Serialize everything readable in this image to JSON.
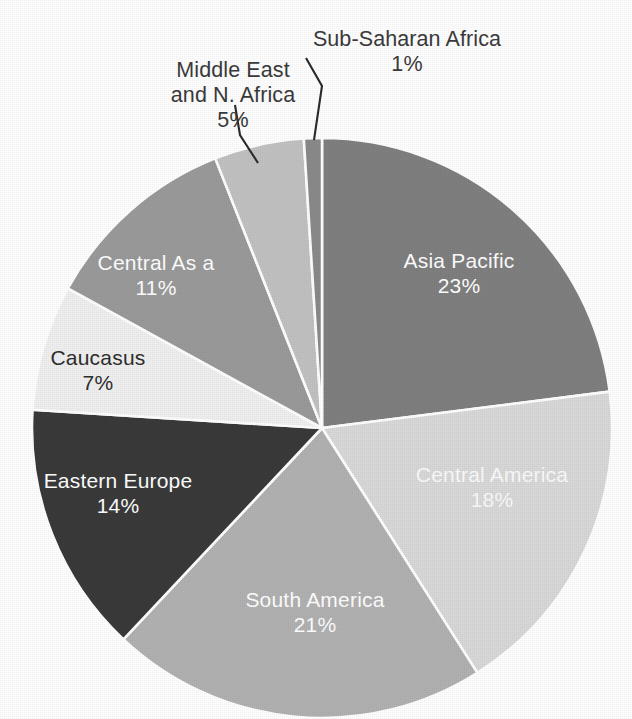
{
  "chart_data": {
    "type": "pie",
    "title": "",
    "legend_position": "none",
    "labels_inside": true,
    "center": [
      322,
      428
    ],
    "radius": 290,
    "start_angle_deg": 0,
    "direction": "clockwise",
    "categories": [
      "Asia Pacific",
      "Central America",
      "South America",
      "Eastern Europe",
      "Caucasus",
      "Central Asia",
      "Middle East and N. Africa",
      "Sub-Saharan Africa"
    ],
    "values": [
      23,
      18,
      21,
      14,
      7,
      11,
      5,
      1
    ],
    "value_suffix": "%",
    "slices": [
      {
        "name": "Asia Pacific",
        "label": "Asia Pacific",
        "value": 23,
        "percent_text": "23%",
        "color": "#808080",
        "text_color": "#ffffff",
        "label_placement": "inside"
      },
      {
        "name": "Central America",
        "label": "Central America",
        "value": 18,
        "percent_text": "18%",
        "color": "#d9d9d9",
        "text_color": "#fbfbfb",
        "label_placement": "inside"
      },
      {
        "name": "South America",
        "label": "South America",
        "value": 21,
        "percent_text": "21%",
        "color": "#b2b2b2",
        "text_color": "#ffffff",
        "label_placement": "inside"
      },
      {
        "name": "Eastern Europe",
        "label": "Eastern Europe",
        "value": 14,
        "percent_text": "14%",
        "color": "#3a3a3a",
        "text_color": "#ffffff",
        "label_placement": "inside"
      },
      {
        "name": "Caucasus",
        "label": "Caucasus",
        "value": 7,
        "percent_text": "7%",
        "color": "#f0f0f0",
        "text_color": "#2e2e2e",
        "label_placement": "inside"
      },
      {
        "name": "Central Asia",
        "label": "Central As a",
        "value": 11,
        "percent_text": "11%",
        "color": "#9b9b9b",
        "text_color": "#ffffff",
        "label_placement": "inside"
      },
      {
        "name": "Middle East and N. Africa",
        "label": "Middle East\nand N. Africa",
        "value": 5,
        "percent_text": "5%",
        "color": "#c2c2c2",
        "text_color": "#3b3b3b",
        "label_placement": "callout"
      },
      {
        "name": "Sub-Saharan Africa",
        "label": "Sub-Saharan Africa",
        "value": 1,
        "percent_text": "1%",
        "color": "#8a8a8a",
        "text_color": "#3b3b3b",
        "label_placement": "callout"
      }
    ],
    "divider_color": "#ffffff",
    "background": "#ffffff"
  },
  "labels": {
    "sub_saharan_africa": {
      "name": "Sub-Saharan Africa",
      "percent": "1%"
    },
    "middle_east": {
      "name": "Middle East\nand N. Africa",
      "percent": "5%"
    },
    "asia_pacific": {
      "name": "Asia Pacific",
      "percent": "23%"
    },
    "central_america": {
      "name": "Central America",
      "percent": "18%"
    },
    "south_america": {
      "name": "South America",
      "percent": "21%"
    },
    "eastern_europe": {
      "name": "Eastern Europe",
      "percent": "14%"
    },
    "caucasus": {
      "name": "Caucasus",
      "percent": "7%"
    },
    "central_asia": {
      "name": "Central As a",
      "percent": "11%"
    }
  }
}
